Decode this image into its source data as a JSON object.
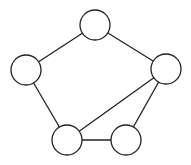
{
  "diagram": {
    "type": "undirected-graph",
    "style": {
      "background": "#ffffff",
      "stroke_color": "#222222",
      "node_fill": "#ffffff",
      "node_radius": 15
    },
    "nodes": [
      {
        "id": "top",
        "x": 95,
        "y": 25,
        "label": ""
      },
      {
        "id": "left",
        "x": 26,
        "y": 70,
        "label": ""
      },
      {
        "id": "right",
        "x": 166,
        "y": 69,
        "label": ""
      },
      {
        "id": "bottom-left",
        "x": 67,
        "y": 140,
        "label": ""
      },
      {
        "id": "bottom-right",
        "x": 126,
        "y": 140,
        "label": ""
      }
    ],
    "edges": [
      {
        "from": "top",
        "to": "left"
      },
      {
        "from": "top",
        "to": "right"
      },
      {
        "from": "left",
        "to": "bottom-left"
      },
      {
        "from": "right",
        "to": "bottom-left"
      },
      {
        "from": "right",
        "to": "bottom-right"
      },
      {
        "from": "bottom-left",
        "to": "bottom-right"
      }
    ]
  }
}
